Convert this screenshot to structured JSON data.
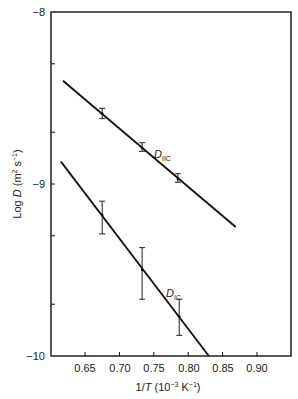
{
  "chart_data": {
    "type": "line",
    "title": "",
    "xlabel": "1/T (10^-3 K^-1)",
    "ylabel": "Log D (m^2 s^-1)",
    "xlim": [
      0.6,
      0.95
    ],
    "ylim": [
      -10,
      -8
    ],
    "x_ticks": [
      "0.65",
      "0.70",
      "0.75",
      "0.80",
      "0.85",
      "0.90"
    ],
    "y_ticks": [
      "-8",
      "-9",
      "-10"
    ],
    "grid": false,
    "legend": "inline labels",
    "series": [
      {
        "name": "D_IIC",
        "label_main": "D",
        "label_sub": "IIC",
        "fit_line": {
          "x": [
            0.618,
            0.869
          ],
          "y": [
            -8.4,
            -9.25
          ]
        },
        "points": [
          {
            "x": 0.675,
            "y": -8.59,
            "err_low": -8.62,
            "err_high": -8.56
          },
          {
            "x": 0.733,
            "y": -8.79,
            "err_low": -8.81,
            "err_high": -8.76
          },
          {
            "x": 0.785,
            "y": -8.97,
            "err_low": -8.99,
            "err_high": -8.94
          }
        ]
      },
      {
        "name": "D_IC",
        "label_main": "D",
        "label_sub": "IC",
        "fit_line": {
          "x": [
            0.615,
            0.83
          ],
          "y": [
            -8.87,
            -10.0
          ]
        },
        "points": [
          {
            "x": 0.675,
            "y": -9.18,
            "err_low": -9.29,
            "err_high": -9.1
          },
          {
            "x": 0.733,
            "y": -9.5,
            "err_low": -9.67,
            "err_high": -9.37
          },
          {
            "x": 0.787,
            "y": -9.77,
            "err_low": -9.88,
            "err_high": -9.67
          }
        ]
      }
    ]
  },
  "axes": {
    "y_label_main": "Log ",
    "y_label_var": "D",
    "y_label_unit": " (m",
    "y_label_sup1": "2",
    "y_label_mid": " s",
    "y_label_sup2": "−1",
    "y_label_end": ")",
    "x_label_pre": "1/",
    "x_label_var": "T",
    "x_label_unit": " (10",
    "x_label_sup1": "−3",
    "x_label_mid": " K",
    "x_label_sup2": "−1",
    "x_label_end": ")",
    "y_tick_labels": [
      "−8",
      "−9",
      "−10"
    ],
    "x_tick_labels": [
      "0.65",
      "0.70",
      "0.75",
      "0.80",
      "0.85",
      "0.90"
    ]
  }
}
